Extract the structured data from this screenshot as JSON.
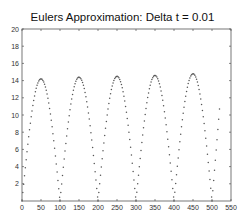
{
  "chart_data": {
    "type": "scatter",
    "title": "Eulers Approximation: Delta t = 0.01",
    "xlabel": "",
    "ylabel": "",
    "xlim": [
      0,
      550
    ],
    "ylim": [
      0,
      20
    ],
    "x_ticks": [
      0,
      50,
      100,
      150,
      200,
      250,
      300,
      350,
      400,
      450,
      500,
      550
    ],
    "y_ticks": [
      2,
      4,
      6,
      8,
      10,
      12,
      14,
      16,
      18,
      20
    ],
    "grid": false,
    "legend": null,
    "marker_color": "#555555",
    "series": [
      {
        "name": "euler",
        "description": "repeated bouncing arcs: zero at x=0,100,200,300,400,500; peaks near x=50,150,250,350,450; ends near x=520",
        "peaks": [
          {
            "x": 50,
            "y": 14.2
          },
          {
            "x": 150,
            "y": 14.4
          },
          {
            "x": 250,
            "y": 14.5
          },
          {
            "x": 350,
            "y": 14.6
          },
          {
            "x": 450,
            "y": 14.8
          }
        ],
        "zeros_x": [
          0,
          100,
          200,
          300,
          400,
          500
        ],
        "end": {
          "x": 520,
          "y": 10.8
        }
      }
    ]
  }
}
